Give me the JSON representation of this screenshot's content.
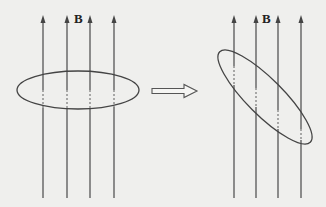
{
  "figure": {
    "panels": [
      {
        "name": "initial",
        "field_label": "B",
        "field_direction": "up",
        "field_line_count": 4,
        "loop_orientation": "horizontal (plane perpendicular to B)"
      },
      {
        "name": "rotated",
        "field_label": "B",
        "field_direction": "up",
        "field_line_count": 4,
        "loop_orientation": "tilted"
      }
    ],
    "transition": {
      "icon": "hollow-right-arrow-icon"
    }
  }
}
